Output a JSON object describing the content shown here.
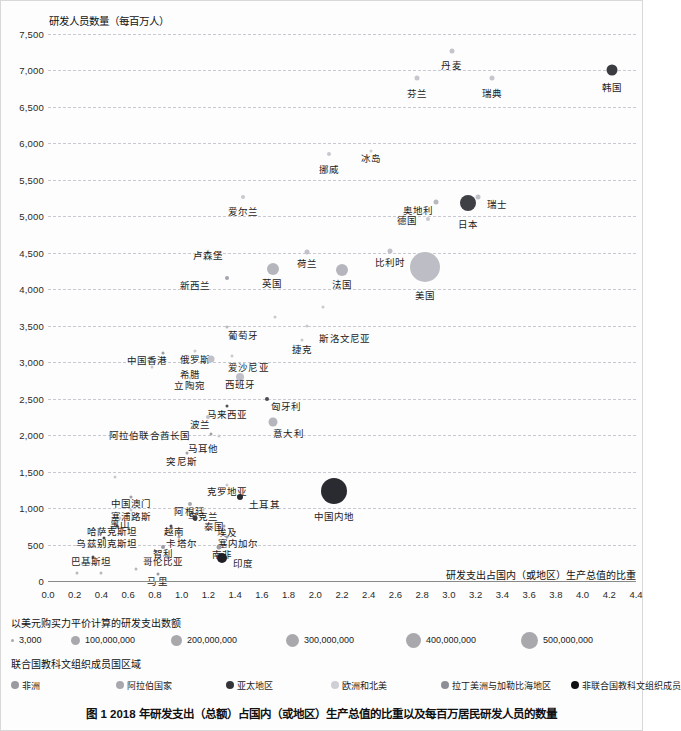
{
  "caption": "图 1  2018 年研发支出（总额）占国内（或地区）生产总值的比重以及每百万居民研发人员的数量",
  "size_legend": {
    "title": "以美元购买力平价计算的研发支出数额",
    "items": [
      {
        "label": "3,000",
        "d": 3
      },
      {
        "label": "100,000,000",
        "d": 9
      },
      {
        "label": "200,000,000",
        "d": 11
      },
      {
        "label": "300,000,000",
        "d": 13
      },
      {
        "label": "400,000,000",
        "d": 15
      },
      {
        "label": "500,000,000",
        "d": 17
      }
    ]
  },
  "region_legend": {
    "title": "联合国教科文组织成员国区域",
    "items": [
      {
        "label": "非洲",
        "color": "#9a9aa0"
      },
      {
        "label": "阿拉伯国家",
        "color": "#a8a8ae"
      },
      {
        "label": "亚太地区",
        "color": "#33333a"
      },
      {
        "label": "欧洲和北美",
        "color": "#cfcfd6"
      },
      {
        "label": "拉丁美洲与加勒比海地区",
        "color": "#8e8e96"
      },
      {
        "label": "非联合国教科文组织成员",
        "color": "#111114"
      }
    ]
  },
  "chart_data": {
    "type": "scatter",
    "title": "图 1  2018 年研发支出（总额）占国内（或地区）生产总值的比重以及每百万居民研发人员的数量",
    "xlabel": "研发支出占国内（或地区）生产总值的比重",
    "ylabel": "研发人员数量（每百万人）",
    "xlim": [
      0.0,
      4.4
    ],
    "ylim": [
      0,
      7500
    ],
    "grid": true,
    "xticks": [
      "0.0",
      "0.2",
      "0.4",
      "0.6",
      "0.8",
      "1.0",
      "1.2",
      "1.4",
      "1.6",
      "1.8",
      "2.0",
      "2.2",
      "2.4",
      "2.6",
      "2.8",
      "3.0",
      "3.2",
      "3.4",
      "3.6",
      "3.8",
      "4.0",
      "4.2",
      "4.4"
    ],
    "yticks": [
      "0",
      "500",
      "1,000",
      "1,500",
      "2,000",
      "2,500",
      "3,000",
      "3,500",
      "4,000",
      "4,500",
      "5,000",
      "5,500",
      "6,000",
      "6,500",
      "7,000",
      "7,500"
    ],
    "legend_position": "bottom",
    "size_encoding": "以美元购买力平价计算的研发支出数额",
    "color_encoding": "联合国教科文组织成员国区域",
    "points": [
      {
        "name": "韩国",
        "x": 4.22,
        "y": 7000,
        "d": 11,
        "color": "#3b3b42",
        "lx": 4.22,
        "ly": 6830
      },
      {
        "name": "丹麦",
        "x": 3.02,
        "y": 7270,
        "d": 5,
        "color": "#c4c4cc",
        "lx": 3.02,
        "ly": 7130
      },
      {
        "name": "芬兰",
        "x": 2.76,
        "y": 6890,
        "d": 5,
        "color": "#c6c6cd",
        "lx": 2.76,
        "ly": 6750
      },
      {
        "name": "瑞典",
        "x": 3.32,
        "y": 6900,
        "d": 5,
        "color": "#c6c6cd",
        "lx": 3.32,
        "ly": 6750
      },
      {
        "name": "挪威",
        "x": 2.1,
        "y": 5860,
        "d": 4,
        "color": "#c8c8cf",
        "lx": 2.1,
        "ly": 5710
      },
      {
        "name": "冰岛",
        "x": 2.42,
        "y": 5900,
        "d": 3,
        "color": "#cccfd4",
        "lx": 2.42,
        "ly": 5860
      },
      {
        "name": "爱尔兰",
        "x": 1.46,
        "y": 5270,
        "d": 4,
        "color": "#c8c8cf",
        "lx": 1.46,
        "ly": 5130
      },
      {
        "name": "瑞士",
        "x": 3.22,
        "y": 5270,
        "d": 5,
        "color": "#c0c0c8",
        "lx": 3.36,
        "ly": 5230
      },
      {
        "name": "奥地利",
        "x": 2.9,
        "y": 5190,
        "d": 5,
        "color": "#b8b8c0",
        "lx": 2.77,
        "ly": 5140
      },
      {
        "name": "日本",
        "x": 3.14,
        "y": 5180,
        "d": 16,
        "color": "#3f3f46",
        "lx": 3.14,
        "ly": 4950
      },
      {
        "name": "德国",
        "x": 2.84,
        "y": 4960,
        "d": 4,
        "color": "#c8c8cf",
        "lx": 2.69,
        "ly": 5000
      },
      {
        "name": "卢森堡",
        "x": 1.2,
        "y": 4530,
        "d": 3,
        "color": "#cccfd4",
        "lx": 1.2,
        "ly": 4520
      },
      {
        "name": "荷兰",
        "x": 1.94,
        "y": 4510,
        "d": 5,
        "color": "#c2c2ca",
        "lx": 1.94,
        "ly": 4420
      },
      {
        "name": "比利时",
        "x": 2.56,
        "y": 4520,
        "d": 5,
        "color": "#c2c2ca",
        "lx": 2.56,
        "ly": 4430
      },
      {
        "name": "美国",
        "x": 2.82,
        "y": 4300,
        "d": 30,
        "color": "#bdbdc6",
        "lx": 2.82,
        "ly": 3970
      },
      {
        "name": "英国",
        "x": 1.68,
        "y": 4280,
        "d": 12,
        "color": "#b5b5bd",
        "lx": 1.68,
        "ly": 4140
      },
      {
        "name": "法国",
        "x": 2.2,
        "y": 4270,
        "d": 12,
        "color": "#b5b5bd",
        "lx": 2.2,
        "ly": 4130
      },
      {
        "name": "新西兰",
        "x": 1.34,
        "y": 4150,
        "d": 4,
        "color": "#a4a4ac",
        "lx": 1.1,
        "ly": 4110
      },
      {
        "name": "葡萄牙",
        "x": 1.34,
        "y": 3480,
        "d": 3,
        "color": "#b9b9c1",
        "lx": 1.46,
        "ly": 3430
      },
      {
        "name": "斯洛文尼亚",
        "x": 1.94,
        "y": 3500,
        "d": 3,
        "color": "#c9c9d0",
        "lx": 2.22,
        "ly": 3380
      },
      {
        "name": "捷克",
        "x": 1.9,
        "y": 3310,
        "d": 3,
        "color": "#c9c9d0",
        "lx": 1.9,
        "ly": 3230
      },
      {
        "name": "俄罗斯",
        "x": 1.1,
        "y": 3160,
        "d": 3,
        "color": "#c9c9d0",
        "lx": 1.1,
        "ly": 3100
      },
      {
        "name": "爱沙尼亚",
        "x": 1.38,
        "y": 3080,
        "d": 3,
        "color": "#c9c9d0",
        "lx": 1.5,
        "ly": 2990
      },
      {
        "name": "中国香港",
        "x": 0.86,
        "y": 3130,
        "d": 3,
        "color": "#9e9ea6",
        "lx": 0.74,
        "ly": 3080
      },
      {
        "name": "希腊",
        "x": 1.22,
        "y": 3040,
        "d": 7,
        "color": "#c0c0c8",
        "lx": 1.06,
        "ly": 2890
      },
      {
        "name": "立陶宛",
        "x": 1.06,
        "y": 2790,
        "d": 3,
        "color": "#c9c9d0",
        "lx": 1.06,
        "ly": 2740
      },
      {
        "name": "西班牙",
        "x": 1.44,
        "y": 2800,
        "d": 8,
        "color": "#c0c0c8",
        "lx": 1.44,
        "ly": 2750
      },
      {
        "name": "匈牙利",
        "x": 1.64,
        "y": 2500,
        "d": 4,
        "color": "#4b4b54",
        "lx": 1.78,
        "ly": 2450
      },
      {
        "name": "马来西亚",
        "x": 1.34,
        "y": 2400,
        "d": 3,
        "color": "#4f4f58",
        "lx": 1.34,
        "ly": 2340
      },
      {
        "name": "波兰",
        "x": 1.2,
        "y": 2250,
        "d": 4,
        "color": "#c0c0c8",
        "lx": 1.14,
        "ly": 2210
      },
      {
        "name": "意大利",
        "x": 1.68,
        "y": 2180,
        "d": 9,
        "color": "#b5b5bd",
        "lx": 1.8,
        "ly": 2080
      },
      {
        "name": "阿拉伯联合酋长国",
        "x": 1.22,
        "y": 2020,
        "d": 3,
        "color": "#a0a0a8",
        "lx": 0.76,
        "ly": 2050
      },
      {
        "name": "马耳他",
        "x": 1.28,
        "y": 1990,
        "d": 3,
        "color": "#c9c9d0",
        "lx": 1.16,
        "ly": 1880
      },
      {
        "name": "突尼斯",
        "x": 1.04,
        "y": 1760,
        "d": 3,
        "color": "#a0a0a8",
        "lx": 1.0,
        "ly": 1700
      },
      {
        "name": "克罗地亚",
        "x": 1.34,
        "y": 1310,
        "d": 3,
        "color": "#c9c9d0",
        "lx": 1.34,
        "ly": 1290
      },
      {
        "name": "土耳其",
        "x": 1.44,
        "y": 1150,
        "d": 6,
        "color": "#2b2b32",
        "lx": 1.62,
        "ly": 1110
      },
      {
        "name": "中国澳门",
        "x": 0.62,
        "y": 1150,
        "d": 3,
        "color": "#9e9ea6",
        "lx": 0.62,
        "ly": 1120
      },
      {
        "name": "阿根廷",
        "x": 1.06,
        "y": 1060,
        "d": 4,
        "color": "#a8a8b0",
        "lx": 1.06,
        "ly": 1010
      },
      {
        "name": "塞浦路斯",
        "x": 0.62,
        "y": 980,
        "d": 3,
        "color": "#c9c9d0",
        "lx": 0.62,
        "ly": 940
      },
      {
        "name": "乌克兰",
        "x": 1.16,
        "y": 980,
        "d": 3,
        "color": "#c9c9d0",
        "lx": 1.16,
        "ly": 940
      },
      {
        "name": "黑山",
        "x": 0.54,
        "y": 870,
        "d": 3,
        "color": "#c9c9d0",
        "lx": 0.54,
        "ly": 830
      },
      {
        "name": "泰国",
        "x": 1.1,
        "y": 870,
        "d": 5,
        "color": "#3b3b42",
        "lx": 1.24,
        "ly": 810
      },
      {
        "name": "哈萨克斯坦",
        "x": 0.52,
        "y": 760,
        "d": 3,
        "color": "#3f3f48",
        "lx": 0.48,
        "ly": 740
      },
      {
        "name": "越南",
        "x": 0.92,
        "y": 760,
        "d": 3,
        "color": "#4a4a52",
        "lx": 0.94,
        "ly": 740
      },
      {
        "name": "埃及",
        "x": 1.32,
        "y": 760,
        "d": 3,
        "color": "#a0a0a8",
        "lx": 1.34,
        "ly": 730
      },
      {
        "name": "乌兹别克斯坦",
        "x": 0.42,
        "y": 590,
        "d": 3,
        "color": "#4a4a52",
        "lx": 0.44,
        "ly": 570
      },
      {
        "name": "卡塔尔",
        "x": 0.98,
        "y": 600,
        "d": 3,
        "color": "#a0a0a8",
        "lx": 1.0,
        "ly": 570
      },
      {
        "name": "塞内加尔",
        "x": 1.34,
        "y": 600,
        "d": 3,
        "color": "#9a9aa2",
        "lx": 1.42,
        "ly": 570
      },
      {
        "name": "智利",
        "x": 0.86,
        "y": 470,
        "d": 4,
        "color": "#9a9aa2",
        "lx": 0.86,
        "ly": 440
      },
      {
        "name": "南非",
        "x": 1.28,
        "y": 470,
        "d": 5,
        "color": "#9a9aa2",
        "lx": 1.3,
        "ly": 420
      },
      {
        "name": "巴基斯坦",
        "x": 0.34,
        "y": 330,
        "d": 3,
        "color": "#4f4f58",
        "lx": 0.32,
        "ly": 330
      },
      {
        "name": "哥伦比亚",
        "x": 0.9,
        "y": 330,
        "d": 4,
        "color": "#9a9aa2",
        "lx": 0.86,
        "ly": 330
      },
      {
        "name": "印度",
        "x": 1.3,
        "y": 310,
        "d": 10,
        "color": "#1f1f26",
        "lx": 1.46,
        "ly": 300
      },
      {
        "name": "马里",
        "x": 0.82,
        "y": 90,
        "d": 3,
        "color": "#9a9aa2",
        "lx": 0.82,
        "ly": 60
      },
      {
        "name": "p1",
        "x": 0.22,
        "y": 110,
        "d": 3,
        "color": "#b8b8c0",
        "lx": null,
        "ly": null
      },
      {
        "name": "p2",
        "x": 0.4,
        "y": 110,
        "d": 3,
        "color": "#b8b8c0",
        "lx": null,
        "ly": null
      },
      {
        "name": "p3",
        "x": 0.66,
        "y": 160,
        "d": 3,
        "color": "#b8b8c0",
        "lx": null,
        "ly": null
      },
      {
        "name": "p4",
        "x": 0.5,
        "y": 1420,
        "d": 3,
        "color": "#c9c9d0",
        "lx": null,
        "ly": null
      },
      {
        "name": "p5",
        "x": 0.78,
        "y": 2940,
        "d": 3,
        "color": "#c9c9d0",
        "lx": null,
        "ly": null
      },
      {
        "name": "p6",
        "x": 1.7,
        "y": 3620,
        "d": 3,
        "color": "#c9c9d0",
        "lx": null,
        "ly": null
      },
      {
        "name": "p7",
        "x": 2.06,
        "y": 3760,
        "d": 3,
        "color": "#c9c9d0",
        "lx": null,
        "ly": null
      },
      {
        "name": "中国内地",
        "x": 2.14,
        "y": 1230,
        "d": 26,
        "color": "#2a2a31",
        "lx": 2.14,
        "ly": 950
      }
    ]
  }
}
